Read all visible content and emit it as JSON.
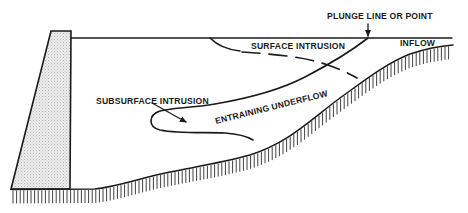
{
  "diagram": {
    "type": "reservoir density-current cross-section",
    "colors": {
      "ink": "#1a1a1a",
      "dam_fill": "#e6e6e6",
      "background": "#ffffff"
    },
    "labels": {
      "plunge": "PLUNGE LINE OR POINT",
      "surface_intrusion": "SURFACE INTRUSION",
      "inflow": "INFLOW",
      "subsurface_intrusion": "SUBSURFACE INTRUSION",
      "entraining_underflow": "ENTRAINING UNDERFLOW"
    },
    "elements": [
      {
        "name": "dam",
        "shape": "trapezoid",
        "fill": "stippled gray"
      },
      {
        "name": "water-surface",
        "shape": "horizontal line"
      },
      {
        "name": "reservoir-bed",
        "shape": "hatched ground line"
      },
      {
        "name": "plunge-arrow",
        "points_to": "plunge point on water surface"
      },
      {
        "name": "surface-intrusion-boundary",
        "style": "dashed curve"
      },
      {
        "name": "underflow-upper-boundary",
        "style": "solid curve"
      },
      {
        "name": "subsurface-intrusion-loop",
        "style": "solid curve"
      },
      {
        "name": "subsurface-intrusion-arrow",
        "style": "leader arrow"
      }
    ]
  }
}
